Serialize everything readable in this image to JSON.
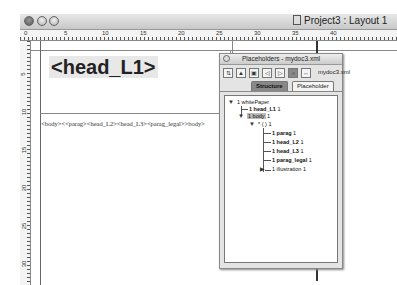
{
  "window": {
    "title": "Project3 : Layout 1",
    "traffic_lights": [
      "close",
      "minimize",
      "zoom"
    ]
  },
  "rulers": {
    "horizontal": [
      "0",
      "5",
      "10",
      "15",
      "20",
      "25",
      "30",
      "35",
      "40"
    ],
    "vertical": [
      "5",
      "10",
      "15",
      "20",
      "25",
      "30",
      "35"
    ]
  },
  "canvas": {
    "heading": "<head_L1>",
    "body_text": "<body><<parag><head_L2><head_L3><parag_legal>>body>"
  },
  "palette": {
    "title": "Placeholders - mydoc3.xml",
    "filename": "mydoc3.xml",
    "toolbar_icons": [
      "add-tag-icon",
      "insert-node-icon",
      "insert-child-icon",
      "move-left-icon",
      "move-right-icon",
      "rescan-icon",
      "link-icon"
    ],
    "tabs": [
      {
        "label": "Structure",
        "active": true
      },
      {
        "label": "Placeholder",
        "active": false
      }
    ],
    "tree": [
      {
        "text": "1 whitePaper",
        "level": 0,
        "expanded": true
      },
      {
        "text": "1 head_L1",
        "suffix": "1",
        "level": 1,
        "bold": true
      },
      {
        "text": "1 body",
        "suffix": "1",
        "level": 1,
        "expanded": true,
        "selected": true
      },
      {
        "text": "* ( )",
        "suffix": "1",
        "level": 2,
        "expanded": true
      },
      {
        "text": "1 parag",
        "suffix": "1",
        "level": 3,
        "bold": true
      },
      {
        "text": "1 head_L2",
        "suffix": "1",
        "level": 3,
        "bold": true
      },
      {
        "text": "1 head_L3",
        "suffix": "1",
        "level": 3,
        "bold": true
      },
      {
        "text": "1 parag_legal",
        "suffix": "1",
        "level": 3,
        "bold": true
      },
      {
        "text": "1 illustration",
        "suffix": "1",
        "level": 3,
        "collapsed": true
      }
    ]
  }
}
